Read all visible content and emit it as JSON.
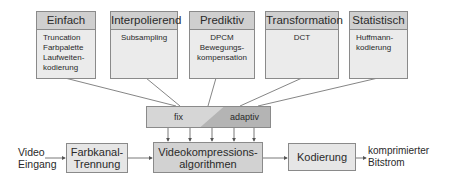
{
  "categories": [
    {
      "title": "Einfach",
      "items": [
        "Truncation",
        "Farbpalette",
        "Laufweiten-",
        "kodierung"
      ]
    },
    {
      "title": "Interpolierend",
      "items": [
        "Subsampling"
      ]
    },
    {
      "title": "Prediktiv",
      "items": [
        "DPCM",
        "Bewegungs-",
        "kompensation"
      ]
    },
    {
      "title": "Transformation",
      "items": [
        "DCT"
      ]
    },
    {
      "title": "Statistisch",
      "items": [
        "Huffmann-",
        "kodierung"
      ]
    }
  ],
  "mode_bar": {
    "fixed_label": "fix",
    "adaptive_label": "adaptiv"
  },
  "pipeline": {
    "input": {
      "line1": "Video",
      "line2": "Eingang"
    },
    "color_separation": {
      "line1": "Farbkanal-",
      "line2": "Trennung"
    },
    "compression": {
      "line1": "Videokompressions-",
      "line2": "algorithmen"
    },
    "coding": {
      "line1": "Kodierung"
    },
    "output": {
      "line1": "komprimierter",
      "line2": "Bitstrom"
    }
  },
  "colors": {
    "header_fill": "#cfcfcf",
    "box_fill": "#ebebeb",
    "dark_fill": "#b8b8b8",
    "border": "#8a8a8a"
  }
}
